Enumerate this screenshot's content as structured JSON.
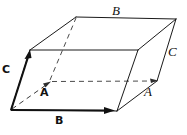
{
  "figure": {
    "background_color": "#ffffff",
    "stroke_color": "#1a1a1a",
    "hidden_stroke_color": "#4a4a4a",
    "width": 187,
    "height": 135
  },
  "vectors": {
    "a": {
      "label": "A",
      "style": "bold",
      "description": "vector A drawn dashed from origin toward back-left",
      "origin": [
        11,
        110
      ],
      "tip": [
        50,
        82
      ]
    },
    "b": {
      "label": "B",
      "style": "bold",
      "description": "vector B drawn solid along the bottom front edge",
      "origin": [
        11,
        110
      ],
      "tip": [
        113,
        110
      ]
    },
    "c": {
      "label": "C",
      "style": "bold",
      "description": "vector C drawn solid up the front left edge",
      "origin": [
        11,
        110
      ],
      "tip": [
        30,
        51
      ]
    }
  },
  "edge_labels": {
    "a": {
      "label": "A",
      "style": "italic"
    },
    "b": {
      "label": "B",
      "style": "italic"
    },
    "c": {
      "label": "C",
      "style": "italic"
    }
  },
  "geometry": {
    "vertices": {
      "front_bottom_left": [
        11,
        110
      ],
      "front_bottom_right": [
        117,
        111
      ],
      "front_top_left": [
        30,
        50
      ],
      "front_top_right": [
        138,
        50
      ],
      "back_bottom_left": [
        50,
        82
      ],
      "back_bottom_right": [
        157,
        81
      ],
      "back_top_left": [
        76,
        17
      ],
      "back_top_right": [
        176,
        19
      ]
    },
    "solid_edges": [
      [
        "front_bottom_left",
        "front_bottom_right"
      ],
      [
        "front_bottom_left",
        "front_top_left"
      ],
      [
        "front_bottom_right",
        "front_top_right"
      ],
      [
        "front_top_left",
        "front_top_right"
      ],
      [
        "front_top_left",
        "back_top_left"
      ],
      [
        "front_top_right",
        "back_top_right"
      ],
      [
        "back_top_left",
        "back_top_right"
      ],
      [
        "front_bottom_right",
        "back_bottom_right"
      ],
      [
        "back_bottom_right",
        "back_top_right"
      ]
    ],
    "hidden_edges": [
      [
        "back_bottom_left",
        "back_bottom_right"
      ],
      [
        "back_bottom_left",
        "back_top_left"
      ],
      [
        "front_bottom_left",
        "back_bottom_left"
      ]
    ]
  }
}
